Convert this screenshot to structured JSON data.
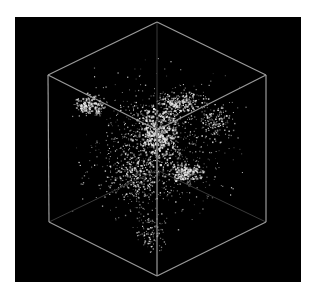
{
  "figure": {
    "caption_cut_off": "",
    "colors": {
      "background": "#000000",
      "page": "#ffffff",
      "cube_edge": "#9a9a9a",
      "cube_back_edge": "#3a3a3a",
      "points": "#e8e8e8"
    },
    "cube": {
      "top_apex": [
        142,
        5
      ],
      "left_top": [
        33,
        58
      ],
      "right_top": [
        251,
        58
      ],
      "center": [
        142,
        113
      ],
      "left_bottom": [
        34,
        205
      ],
      "right_bottom": [
        251,
        205
      ],
      "bottom_apex": [
        142,
        259
      ],
      "back_center": [
        142,
        153
      ]
    },
    "clusters": [
      {
        "cx": 142,
        "cy": 115,
        "rx": 30,
        "ry": 40,
        "n": 420,
        "w": 1.6
      },
      {
        "cx": 75,
        "cy": 88,
        "rx": 20,
        "ry": 14,
        "n": 180,
        "w": 1.4
      },
      {
        "cx": 165,
        "cy": 85,
        "rx": 35,
        "ry": 14,
        "n": 220,
        "w": 1.3
      },
      {
        "cx": 170,
        "cy": 155,
        "rx": 25,
        "ry": 14,
        "n": 220,
        "w": 1.4
      },
      {
        "cx": 120,
        "cy": 160,
        "rx": 35,
        "ry": 35,
        "n": 260,
        "w": 1.2
      },
      {
        "cx": 200,
        "cy": 105,
        "rx": 25,
        "ry": 25,
        "n": 140,
        "w": 1.2
      },
      {
        "cx": 135,
        "cy": 215,
        "rx": 20,
        "ry": 30,
        "n": 120,
        "w": 1.1
      },
      {
        "cx": 142,
        "cy": 130,
        "rx": 100,
        "ry": 100,
        "n": 900,
        "w": 1.0
      }
    ]
  }
}
